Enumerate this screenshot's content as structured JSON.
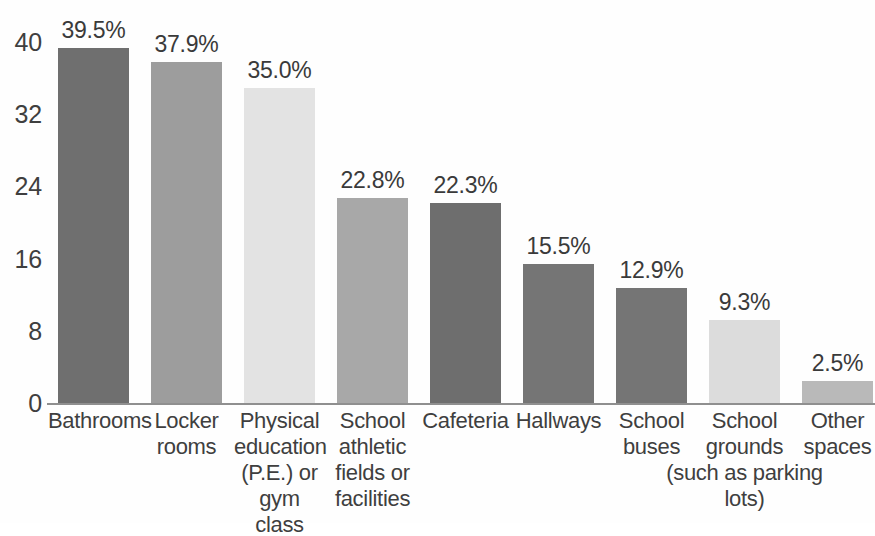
{
  "chart_data": {
    "type": "bar",
    "title": "",
    "subtitle": "",
    "xlabel": "",
    "ylabel": "",
    "ylim": [
      0,
      40
    ],
    "yticks": [
      "0",
      "8",
      "16",
      "24",
      "32",
      "40"
    ],
    "grid": false,
    "legend": null,
    "categories": [
      "Bathrooms",
      "Locker rooms",
      "Physical education (P.E.) or gym class",
      "School athletic fields or facilities",
      "Cafeteria",
      "Hallways",
      "School buses",
      "School grounds",
      "Other spaces"
    ],
    "values": [
      39.5,
      37.9,
      35.0,
      22.8,
      22.3,
      15.5,
      12.9,
      9.3,
      2.5
    ],
    "data_labels": [
      "39.5%",
      "37.9%",
      "35.0%",
      "22.8%",
      "22.3%",
      "15.5%",
      "12.9%",
      "9.3%",
      "2.5%"
    ],
    "bar_colors": [
      "#6f6f6f",
      "#9d9d9d",
      "#e3e3e3",
      "#a8a8a8",
      "#6e6e6e",
      "#757575",
      "#757575",
      "#dcdcdc",
      "#b9b9b9"
    ],
    "annotations": [
      "(such as parking lots)"
    ]
  },
  "axis": {
    "ticks": [
      {
        "label": "40",
        "value": 40
      },
      {
        "label": "32",
        "value": 32
      },
      {
        "label": "24",
        "value": 24
      },
      {
        "label": "16",
        "value": 16
      },
      {
        "label": "8",
        "value": 8
      },
      {
        "label": "0",
        "value": 0
      }
    ],
    "axis_line_color": "#8f8f8f"
  },
  "bars": [
    {
      "label_lines": [
        "Bathrooms"
      ],
      "value": 39.5,
      "data_label": "39.5%",
      "color": "#6f6f6f"
    },
    {
      "label_lines": [
        "Locker",
        "rooms"
      ],
      "value": 37.9,
      "data_label": "37.9%",
      "color": "#9d9d9d"
    },
    {
      "label_lines": [
        "Physical",
        "education",
        "(P.E.) or",
        "gym class"
      ],
      "value": 35.0,
      "data_label": "35.0%",
      "color": "#e3e3e3"
    },
    {
      "label_lines": [
        "School",
        "athletic",
        "fields or",
        "facilities"
      ],
      "value": 22.8,
      "data_label": "22.8%",
      "color": "#a8a8a8"
    },
    {
      "label_lines": [
        "Cafeteria"
      ],
      "value": 22.3,
      "data_label": "22.3%",
      "color": "#6e6e6e"
    },
    {
      "label_lines": [
        "Hallways"
      ],
      "value": 15.5,
      "data_label": "15.5%",
      "color": "#757575"
    },
    {
      "label_lines": [
        "School",
        "buses"
      ],
      "value": 12.9,
      "data_label": "12.9%",
      "color": "#757575"
    },
    {
      "label_lines": [
        "School",
        "grounds"
      ],
      "value": 9.3,
      "data_label": "9.3%",
      "color": "#dcdcdc"
    },
    {
      "label_lines": [
        "Other",
        "spaces"
      ],
      "value": 2.5,
      "data_label": "2.5%",
      "color": "#b9b9b9"
    }
  ],
  "span_note": {
    "text": "(such as parking lots)",
    "line1": "(such as parking",
    "line2": "lots)"
  }
}
